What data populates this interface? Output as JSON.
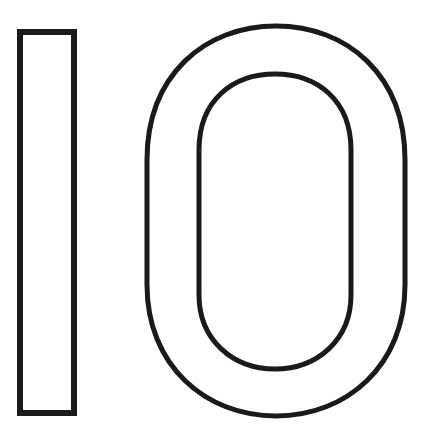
{
  "figure": {
    "number": "10",
    "background": "#ffffff",
    "stroke_color": "#1a1a1a",
    "digit_one": {
      "x": 20,
      "y": 32,
      "width": 54,
      "height": 381,
      "stroke_width": 6
    },
    "digit_zero_outer": {
      "cx": 276,
      "cy": 221,
      "rx": 129,
      "ry": 195,
      "stroke_width": 5
    },
    "digit_zero_inner": {
      "cx": 275,
      "cy": 221,
      "rx": 76,
      "ry": 148,
      "stroke_width": 5
    }
  }
}
